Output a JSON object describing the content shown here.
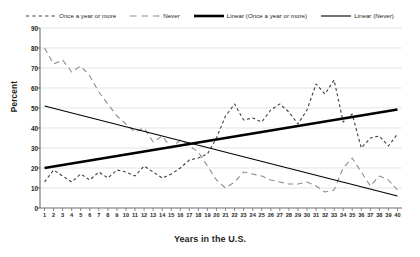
{
  "chart_data": {
    "type": "line",
    "title": "",
    "xlabel": "Years in the U.S.",
    "ylabel": "Percent",
    "ylim": [
      0,
      90
    ],
    "ytick_step": 10,
    "yticks": [
      90,
      80,
      70,
      60,
      50,
      40,
      30,
      20,
      10,
      0
    ],
    "grid": true,
    "legend_position": "top",
    "x": [
      1,
      2,
      3,
      4,
      5,
      6,
      7,
      8,
      9,
      10,
      11,
      12,
      13,
      14,
      15,
      16,
      17,
      18,
      19,
      20,
      21,
      22,
      23,
      24,
      25,
      26,
      27,
      28,
      29,
      30,
      31,
      32,
      33,
      34,
      35,
      36,
      37,
      38,
      39,
      40
    ],
    "categories": [
      "1",
      "2",
      "3",
      "4",
      "5",
      "6",
      "7",
      "8",
      "9",
      "10",
      "11",
      "12",
      "13",
      "14",
      "15",
      "16",
      "17",
      "18",
      "19",
      "20",
      "21",
      "22",
      "23",
      "24",
      "25",
      "26",
      "27",
      "28",
      "29",
      "30",
      "31",
      "32",
      "33",
      "34",
      "35",
      "36",
      "37",
      "38",
      "39",
      "40"
    ],
    "series": [
      {
        "name": "Once a year or more",
        "style": "dashed-short",
        "color": "#3f3f3f",
        "width": 1.1,
        "values": [
          13,
          19,
          16,
          13,
          17,
          14,
          18,
          15,
          19,
          18,
          16,
          21,
          18,
          15,
          17,
          20,
          24,
          25,
          27,
          35,
          46,
          52,
          44,
          45,
          43,
          49,
          52,
          48,
          42,
          49,
          62,
          57,
          64,
          43,
          47,
          30,
          35,
          36,
          31,
          37
        ]
      },
      {
        "name": "Never",
        "style": "dashed-long",
        "color": "#8c8c8c",
        "width": 1.1,
        "values": [
          80,
          72,
          74,
          68,
          71,
          66,
          58,
          52,
          46,
          42,
          38,
          40,
          33,
          36,
          30,
          34,
          31,
          28,
          21,
          14,
          10,
          13,
          18,
          17,
          16,
          14,
          13,
          12,
          12,
          13,
          11,
          8,
          9,
          20,
          25,
          18,
          11,
          16,
          14,
          9
        ]
      },
      {
        "name": "Linear (Once a year or more)",
        "style": "solid-thick",
        "color": "#000000",
        "width": 2.6,
        "trend": true,
        "values": [
          20.0,
          20.75,
          21.5,
          22.25,
          23.0,
          23.75,
          24.5,
          25.25,
          26.0,
          26.75,
          27.5,
          28.25,
          29.0,
          29.75,
          30.5,
          31.25,
          32.0,
          32.75,
          33.5,
          34.25,
          35.0,
          35.75,
          36.5,
          37.25,
          38.0,
          38.75,
          39.5,
          40.25,
          41.0,
          41.75,
          42.5,
          43.25,
          44.0,
          44.75,
          45.5,
          46.25,
          47.0,
          47.75,
          48.5,
          49.25
        ]
      },
      {
        "name": "Linear (Never)",
        "style": "solid-thin",
        "color": "#000000",
        "width": 1.1,
        "trend": true,
        "values": [
          51.0,
          49.85,
          48.69,
          47.54,
          46.38,
          45.23,
          44.08,
          42.92,
          41.77,
          40.62,
          39.46,
          38.31,
          37.15,
          36.0,
          34.85,
          33.69,
          32.54,
          31.38,
          30.23,
          29.08,
          27.92,
          26.77,
          25.62,
          24.46,
          23.31,
          22.15,
          21.0,
          19.85,
          18.69,
          17.54,
          16.38,
          15.23,
          14.08,
          12.92,
          11.77,
          10.62,
          9.46,
          8.31,
          7.15,
          6.0
        ]
      }
    ]
  },
  "legend": {
    "items": [
      {
        "label": "Once a year or more",
        "swatch": "dashed-short-swatch"
      },
      {
        "label": "Never",
        "swatch": "dashed-long-swatch"
      },
      {
        "label": "Linear (Once a year or more)",
        "swatch": "solid-thick-swatch"
      },
      {
        "label": "Linear (Never)",
        "swatch": "solid-thin-swatch"
      }
    ]
  },
  "axes": {
    "y_title": "Percent",
    "x_title": "Years in the U.S."
  },
  "colors": {
    "axis": "#6f6f6f",
    "grid": "#d9d9d9",
    "text": "#231f20",
    "series_once": "#3f3f3f",
    "series_never": "#8c8c8c",
    "trend": "#000000"
  }
}
